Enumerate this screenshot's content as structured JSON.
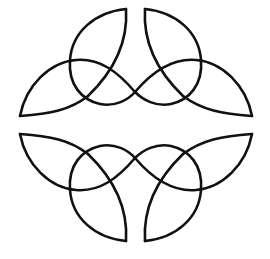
{
  "image": {
    "description": "Celtic knot ornament: two mirrored triquetra-style knots, one above and one below a horizontal gap",
    "stroke_color": "#111111",
    "background_color": "#ffffff",
    "stroke_width": 2.6
  },
  "knots": [
    {
      "name": "upper-knot",
      "position": "top"
    },
    {
      "name": "lower-knot",
      "position": "bottom"
    }
  ]
}
